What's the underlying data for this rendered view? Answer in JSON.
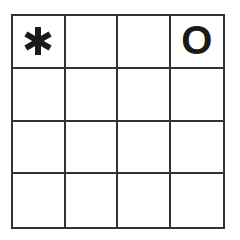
{
  "board": {
    "rows": 4,
    "cols": 4,
    "line_color": "#333333",
    "mark_color": "#1a1a1a",
    "cells": [
      [
        "asterisk",
        "",
        "",
        "O"
      ],
      [
        "",
        "",
        "",
        ""
      ],
      [
        "",
        "",
        "",
        ""
      ],
      [
        "",
        "",
        "",
        ""
      ]
    ],
    "marks": {
      "r0c0": "asterisk",
      "r0c3": "O"
    }
  }
}
